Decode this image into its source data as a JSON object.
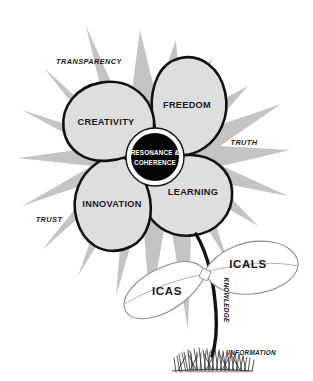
{
  "diagram": {
    "core": {
      "line1": "RESONANCE &",
      "line2": "COHERENCE"
    },
    "petals": [
      {
        "id": "freedom",
        "label": "FREEDOM"
      },
      {
        "id": "learning",
        "label": "LEARNING"
      },
      {
        "id": "innovation",
        "label": "INNOVATION"
      },
      {
        "id": "creativity",
        "label": "CREATIVITY"
      }
    ],
    "rays": [
      {
        "id": "transparency",
        "label": "TRANSPARENCY"
      },
      {
        "id": "truth",
        "label": "TRUTH"
      },
      {
        "id": "trust",
        "label": "TRUST"
      }
    ],
    "leaves": [
      {
        "id": "icals",
        "label": "ICALS"
      },
      {
        "id": "icas",
        "label": "ICAS"
      }
    ],
    "stem": {
      "knowledge": "KNOWLEDGE",
      "information": "INFORMATION"
    },
    "colors": {
      "background": "#ffffff",
      "starburst": "#c4c4c4",
      "petal_fill": "#dedede",
      "petal_stroke": "#111111",
      "core_fill": "#050505",
      "core_text": "#ffffff",
      "leaf_fill": "#ffffff",
      "leaf_stroke": "#8d8d8d",
      "stem_stroke": "#111111",
      "text": "#1a1a1a"
    }
  }
}
